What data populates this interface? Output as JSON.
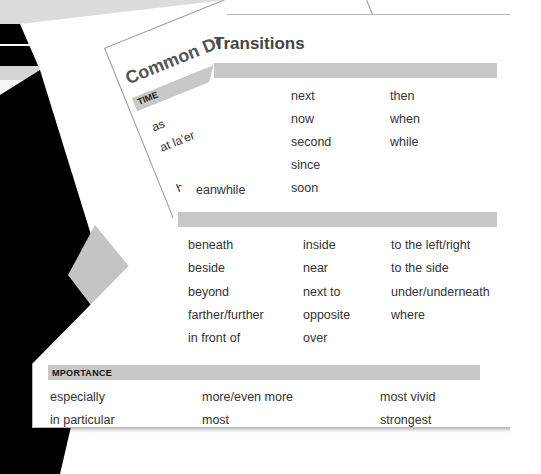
{
  "title": "Transitions",
  "background_page": {
    "title": "Common De",
    "section": "TIME",
    "words": [
      "as",
      "at la’er",
      "ıeanwhile",
      "b"
    ]
  },
  "sections": [
    {
      "label": "",
      "rows": [
        [
          "",
          "next",
          "then"
        ],
        [
          "",
          "now",
          "when"
        ],
        [
          "",
          "second",
          "while"
        ],
        [
          "",
          "since",
          ""
        ],
        [
          "eanwhile",
          "soon",
          ""
        ]
      ]
    },
    {
      "label": "",
      "rows": [
        [
          "beneath",
          "inside",
          "to the left/right"
        ],
        [
          "beside",
          "near",
          "to the side"
        ],
        [
          "beyond",
          "next to",
          "under/underneath"
        ],
        [
          "farther/further",
          "opposite",
          "where"
        ],
        [
          "in front of",
          "over",
          ""
        ]
      ]
    },
    {
      "label": "MPORTANCE",
      "rows": [
        [
          "especially",
          "more/even more",
          "most vivid"
        ],
        [
          "in particular",
          "most",
          "strongest"
        ]
      ]
    }
  ],
  "colors": {
    "section_bar": "#c7c7c7",
    "title_text": "#444444",
    "body_text": "#333333"
  }
}
